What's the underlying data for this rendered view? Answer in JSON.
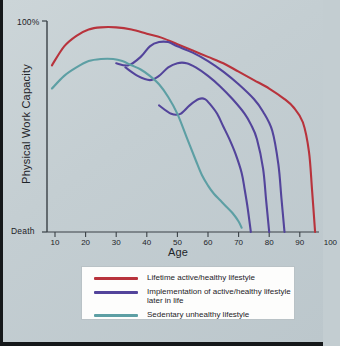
{
  "colors": {
    "background": "#c6d0d4",
    "red": "#b8333c",
    "purple": "#53449b",
    "teal": "#5d9fa4",
    "axis": "#3a4146",
    "text": "#1d2328",
    "legend_bg": "#fdfdfc"
  },
  "axes": {
    "y_top_label": "100%",
    "y_bottom_label": "Death",
    "y_title": "Physical Work Capacity",
    "x_title": "Age",
    "x_ticks": [
      10,
      20,
      30,
      40,
      50,
      60,
      70,
      80,
      90,
      100
    ]
  },
  "legend": {
    "items": [
      {
        "label": "Lifetime active/healthy lifestyle",
        "color": "#b8333c",
        "name": "legend-item-lifetime-active"
      },
      {
        "label": "Implementation of active/healthy lifestyle later in life",
        "color": "#53449b",
        "name": "legend-item-implementation-later"
      },
      {
        "label": "Sedentary unhealthy lifestyle",
        "color": "#5d9fa4",
        "name": "legend-item-sedentary"
      }
    ]
  },
  "chart_data": {
    "type": "line",
    "title": "",
    "xlabel": "Age",
    "ylabel": "Physical Work Capacity",
    "xlim": [
      8,
      102
    ],
    "ylim": [
      0,
      100
    ],
    "ytick_labels": [
      "Death",
      "100%"
    ],
    "ytick_values": [
      0,
      100
    ],
    "xtick_values": [
      10,
      20,
      30,
      40,
      50,
      60,
      70,
      80,
      90,
      100
    ],
    "grid": false,
    "legend_position": "below-axes",
    "series": [
      {
        "name": "Lifetime active/healthy lifestyle",
        "color": "#b8333c",
        "x": [
          9,
          13,
          17,
          21,
          25,
          30,
          35,
          40,
          45,
          50,
          55,
          60,
          65,
          70,
          75,
          80,
          85,
          88,
          91,
          93,
          94,
          95
        ],
        "y": [
          79,
          88,
          93,
          96,
          97,
          97,
          96,
          94,
          92,
          89,
          86,
          83,
          80,
          76,
          72,
          68,
          63,
          59,
          52,
          38,
          20,
          0
        ]
      },
      {
        "name": "Implementation of active/healthy lifestyle later in life (earliest start, ~age 38)",
        "color": "#53449b",
        "x": [
          30,
          34,
          38,
          41,
          44,
          47,
          50,
          55,
          60,
          65,
          70,
          75,
          78,
          81,
          83,
          84,
          85
        ],
        "y": [
          80,
          79,
          83,
          88,
          90,
          90,
          88,
          85,
          81,
          76,
          70,
          63,
          57,
          48,
          32,
          16,
          0
        ]
      },
      {
        "name": "Implementation of active/healthy lifestyle later in life (mid start, ~age 44)",
        "color": "#53449b",
        "x": [
          33,
          37,
          41,
          44,
          47,
          50,
          53,
          56,
          60,
          64,
          68,
          72,
          74,
          76,
          78,
          79,
          80
        ],
        "y": [
          78,
          74,
          72,
          74,
          78,
          80,
          80,
          78,
          74,
          69,
          63,
          56,
          51,
          44,
          30,
          15,
          0
        ]
      },
      {
        "name": "Implementation of active/healthy lifestyle later in life (latest start, ~age 52)",
        "color": "#53449b",
        "x": [
          44,
          48,
          51,
          54,
          57,
          59,
          61,
          63,
          65,
          67,
          69,
          71,
          72,
          73,
          74
        ],
        "y": [
          60,
          56,
          56,
          60,
          63,
          63,
          60,
          56,
          50,
          44,
          37,
          28,
          20,
          11,
          0
        ]
      },
      {
        "name": "Sedentary unhealthy lifestyle",
        "color": "#5d9fa4",
        "x": [
          9,
          13,
          17,
          21,
          25,
          29,
          32,
          35,
          38,
          41,
          44,
          47,
          50,
          53,
          56,
          58,
          60,
          62,
          64,
          66,
          68,
          70,
          71
        ],
        "y": [
          68,
          74,
          78,
          81,
          82,
          82,
          81,
          79,
          77,
          74,
          70,
          64,
          56,
          45,
          34,
          27,
          22,
          18,
          15,
          12,
          9,
          5,
          2
        ]
      }
    ]
  }
}
